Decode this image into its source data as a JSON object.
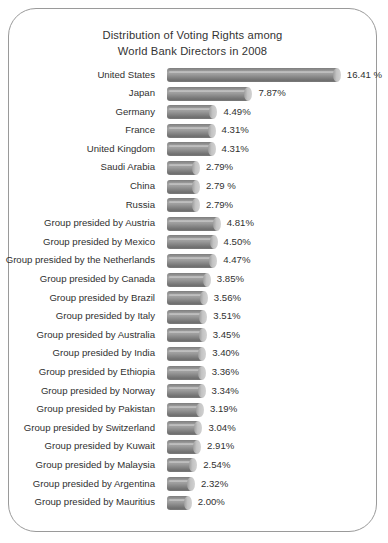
{
  "chart_data": {
    "type": "bar",
    "orientation": "horizontal",
    "title_lines": [
      "Distribution of Voting Rights among",
      "World Bank Directors in 2008"
    ],
    "title": "Distribution of Voting Rights among World Bank Directors in 2008",
    "xlabel": "",
    "ylabel": "",
    "xlim": [
      0,
      16.41
    ],
    "grid": false,
    "legend": "none",
    "unit": "%",
    "categories": [
      "United States",
      "Japan",
      "Germany",
      "France",
      "United Kingdom",
      "Saudi Arabia",
      "China",
      "Russia",
      "Group presided by Austria",
      "Group presided by Mexico",
      "Group presided by the Netherlands",
      "Group presided by Canada",
      "Group presided by Brazil",
      "Group presided by Italy",
      "Group presided by Australia",
      "Group presided by India",
      "Group presided by Ethiopia",
      "Group presided by Norway",
      "Group presided by Pakistan",
      "Group presided by Switzerland",
      "Group presided by Kuwait",
      "Group presided by Malaysia",
      "Group presided by Argentina",
      "Group presided by Mauritius"
    ],
    "values": [
      16.41,
      7.87,
      4.49,
      4.31,
      4.31,
      2.79,
      2.79,
      2.79,
      4.81,
      4.5,
      4.47,
      3.85,
      3.56,
      3.51,
      3.45,
      3.4,
      3.36,
      3.34,
      3.19,
      3.04,
      2.91,
      2.54,
      2.32,
      2.0
    ],
    "value_labels": [
      "16.41 %",
      "7.87%",
      "4.49%",
      "4.31%",
      "4.31%",
      "2.79%",
      "2.79 %",
      "2.79%",
      "4.81%",
      "4.50%",
      "4.47%",
      "3.85%",
      "3.56%",
      "3.51%",
      "3.45%",
      "3.40%",
      "3.36%",
      "3.34%",
      "3.19%",
      "3.04%",
      "2.91%",
      "2.54%",
      "2.32%",
      "2.00%"
    ],
    "bar_style": "3d-cylinder",
    "colors": {
      "bar_dark": "#6f6f6f",
      "bar_mid": "#a6a6a6",
      "bar_cap": "#cccccc",
      "text": "#303030",
      "frame": "#9a9a9a",
      "background": "#ffffff"
    },
    "pixels_per_percent": 10.35,
    "bar_origin_x": 158
  }
}
